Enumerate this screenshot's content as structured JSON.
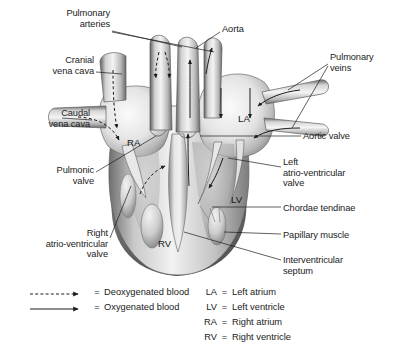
{
  "figure": {
    "background_color": "#ffffff",
    "line_color": "#1c1c1c"
  },
  "labels": [
    {
      "id": "pulmonary-arteries",
      "text": "Pulmonary\narteries",
      "align": "right",
      "x": 18,
      "y": 8,
      "width": 92
    },
    {
      "id": "aorta",
      "text": "Aorta",
      "align": "left",
      "x": 222,
      "y": 24,
      "width": 60
    },
    {
      "id": "cranial-vena-cava",
      "text": "Cranial\nvena cava",
      "align": "right",
      "x": 10,
      "y": 55,
      "width": 84
    },
    {
      "id": "pulmonary-veins",
      "text": "Pulmonary\nveins",
      "align": "left",
      "x": 330,
      "y": 52,
      "width": 62
    },
    {
      "id": "caudal-vena-cava",
      "text": "Caudal\nvena cava",
      "align": "right",
      "x": 6,
      "y": 108,
      "width": 84
    },
    {
      "id": "aortic-valve",
      "text": "Aortic valve",
      "align": "left",
      "x": 303,
      "y": 131,
      "width": 86
    },
    {
      "id": "left-av-valve",
      "text": "Left\natrio-ventricular\nvalve",
      "align": "left",
      "x": 283,
      "y": 157,
      "width": 108
    },
    {
      "id": "pulmonic-valve",
      "text": "Pulmonic\nvalve",
      "align": "right",
      "x": 14,
      "y": 165,
      "width": 80
    },
    {
      "id": "chordae-tendinae",
      "text": "Chordae tendinae",
      "align": "left",
      "x": 283,
      "y": 203,
      "width": 110
    },
    {
      "id": "papillary-muscle",
      "text": "Papillary muscle",
      "align": "left",
      "x": 283,
      "y": 230,
      "width": 108
    },
    {
      "id": "right-av-valve",
      "text": "Right\natrio-ventricular\nvalve",
      "align": "right",
      "x": 0,
      "y": 228,
      "width": 108
    },
    {
      "id": "interventricular-septum",
      "text": "Interventricular\nseptum",
      "align": "left",
      "x": 283,
      "y": 255,
      "width": 104
    }
  ],
  "chamber_labels": [
    {
      "id": "right-atrium-abbrev",
      "text": "RA",
      "x": 127,
      "y": 137
    },
    {
      "id": "left-atrium-abbrev",
      "text": "LA",
      "x": 238,
      "y": 113
    },
    {
      "id": "left-ventricle-abbrev",
      "text": "LV",
      "x": 231,
      "y": 194
    },
    {
      "id": "right-ventricle-abbrev",
      "text": "RV",
      "x": 158,
      "y": 238
    }
  ],
  "legend": {
    "flow_entries": [
      {
        "id": "deoxygenated",
        "symbol": "dashed-arrow",
        "equals": "=",
        "text": "Deoxygenated blood"
      },
      {
        "id": "oxygenated",
        "symbol": "solid-arrow",
        "equals": "=",
        "text": "Oxygenated blood"
      }
    ],
    "abbreviations": [
      {
        "key": "LA",
        "equals": "=",
        "text": "Left atrium"
      },
      {
        "key": "LV",
        "equals": "=",
        "text": "Left ventricle"
      },
      {
        "key": "RA",
        "equals": "=",
        "text": "Right atrium"
      },
      {
        "key": "RV",
        "equals": "=",
        "text": "Right ventricle"
      }
    ]
  }
}
